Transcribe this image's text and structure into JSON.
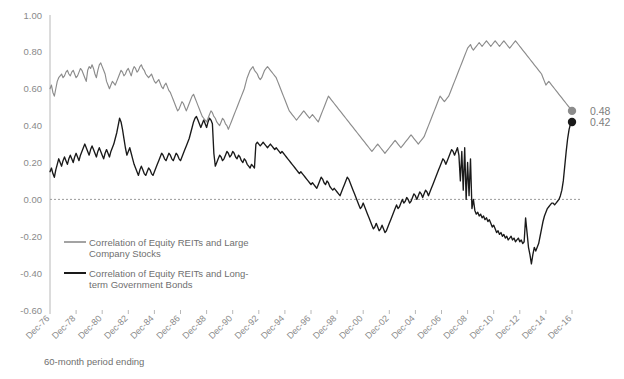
{
  "chart_data": {
    "type": "line",
    "title": "",
    "xlabel": "60-month period ending",
    "ylabel": "",
    "ylim": [
      -0.6,
      1.0
    ],
    "ytick_values": [
      1.0,
      0.8,
      0.6,
      0.4,
      0.2,
      0.0,
      -0.2,
      -0.4,
      -0.6
    ],
    "ytick_labels": [
      "1.00",
      "0.80",
      "0.60",
      "0.40",
      "0.20",
      "0.00",
      "-0.20",
      "-0.40",
      "-0.60"
    ],
    "xtick_labels": [
      "Dec-76",
      "Dec-78",
      "Dec-80",
      "Dec-82",
      "Dec-84",
      "Dec-86",
      "Dec-88",
      "Dec-90",
      "Dec-92",
      "Dec-94",
      "Dec-96",
      "Dec-98",
      "Dec-00",
      "Dec-02",
      "Dec-04",
      "Dec-06",
      "Dec-08",
      "Dec-10",
      "Dec-12",
      "Dec-14",
      "Dec-16"
    ],
    "x_start": 1976.0,
    "x_end": 2016.92,
    "grid": false,
    "zero_line": true,
    "legend_position": "lower-left-inside",
    "series": [
      {
        "name": "Correlation of Equity REITs and Large Company Stocks",
        "color": "#8c8c8c",
        "end_value": 0.48,
        "end_label": "0.48",
        "values": [
          0.6,
          0.62,
          0.58,
          0.56,
          0.6,
          0.64,
          0.66,
          0.67,
          0.68,
          0.66,
          0.67,
          0.69,
          0.7,
          0.68,
          0.67,
          0.69,
          0.7,
          0.68,
          0.66,
          0.67,
          0.69,
          0.71,
          0.7,
          0.68,
          0.66,
          0.64,
          0.7,
          0.72,
          0.71,
          0.73,
          0.71,
          0.68,
          0.66,
          0.7,
          0.73,
          0.74,
          0.72,
          0.7,
          0.68,
          0.64,
          0.62,
          0.6,
          0.62,
          0.64,
          0.63,
          0.62,
          0.64,
          0.66,
          0.68,
          0.7,
          0.69,
          0.67,
          0.68,
          0.7,
          0.71,
          0.69,
          0.67,
          0.7,
          0.72,
          0.71,
          0.69,
          0.7,
          0.72,
          0.73,
          0.71,
          0.7,
          0.68,
          0.67,
          0.66,
          0.67,
          0.68,
          0.66,
          0.64,
          0.63,
          0.64,
          0.65,
          0.63,
          0.61,
          0.6,
          0.62,
          0.63,
          0.61,
          0.59,
          0.58,
          0.56,
          0.54,
          0.52,
          0.5,
          0.48,
          0.49,
          0.51,
          0.53,
          0.52,
          0.5,
          0.48,
          0.5,
          0.52,
          0.54,
          0.56,
          0.57,
          0.55,
          0.53,
          0.51,
          0.49,
          0.47,
          0.45,
          0.44,
          0.43,
          0.42,
          0.44,
          0.46,
          0.48,
          0.47,
          0.45,
          0.44,
          0.42,
          0.41,
          0.4,
          0.42,
          0.44,
          0.43,
          0.41,
          0.4,
          0.38,
          0.4,
          0.42,
          0.44,
          0.46,
          0.48,
          0.5,
          0.52,
          0.54,
          0.56,
          0.58,
          0.6,
          0.63,
          0.66,
          0.68,
          0.7,
          0.71,
          0.72,
          0.7,
          0.69,
          0.68,
          0.66,
          0.65,
          0.66,
          0.68,
          0.7,
          0.71,
          0.72,
          0.71,
          0.7,
          0.69,
          0.68,
          0.67,
          0.66,
          0.64,
          0.62,
          0.6,
          0.58,
          0.56,
          0.54,
          0.52,
          0.5,
          0.48,
          0.47,
          0.46,
          0.45,
          0.44,
          0.43,
          0.44,
          0.45,
          0.46,
          0.47,
          0.48,
          0.47,
          0.46,
          0.45,
          0.44,
          0.45,
          0.46,
          0.45,
          0.44,
          0.43,
          0.42,
          0.44,
          0.46,
          0.48,
          0.5,
          0.52,
          0.54,
          0.56,
          0.55,
          0.54,
          0.53,
          0.52,
          0.51,
          0.5,
          0.49,
          0.48,
          0.47,
          0.46,
          0.45,
          0.44,
          0.43,
          0.42,
          0.41,
          0.4,
          0.39,
          0.38,
          0.37,
          0.36,
          0.35,
          0.34,
          0.33,
          0.32,
          0.31,
          0.3,
          0.29,
          0.28,
          0.27,
          0.26,
          0.27,
          0.28,
          0.29,
          0.3,
          0.29,
          0.28,
          0.27,
          0.26,
          0.25,
          0.26,
          0.27,
          0.28,
          0.29,
          0.3,
          0.31,
          0.32,
          0.31,
          0.3,
          0.29,
          0.28,
          0.29,
          0.3,
          0.31,
          0.32,
          0.33,
          0.34,
          0.35,
          0.34,
          0.33,
          0.32,
          0.31,
          0.3,
          0.31,
          0.32,
          0.33,
          0.34,
          0.36,
          0.38,
          0.4,
          0.42,
          0.44,
          0.46,
          0.48,
          0.5,
          0.52,
          0.54,
          0.56,
          0.55,
          0.54,
          0.53,
          0.54,
          0.55,
          0.56,
          0.58,
          0.6,
          0.62,
          0.64,
          0.66,
          0.68,
          0.7,
          0.72,
          0.74,
          0.76,
          0.78,
          0.8,
          0.82,
          0.83,
          0.84,
          0.82,
          0.81,
          0.82,
          0.83,
          0.84,
          0.85,
          0.84,
          0.83,
          0.84,
          0.85,
          0.86,
          0.85,
          0.84,
          0.83,
          0.84,
          0.85,
          0.86,
          0.85,
          0.84,
          0.83,
          0.84,
          0.85,
          0.86,
          0.85,
          0.84,
          0.83,
          0.82,
          0.83,
          0.84,
          0.85,
          0.86,
          0.85,
          0.84,
          0.83,
          0.82,
          0.81,
          0.8,
          0.79,
          0.78,
          0.77,
          0.76,
          0.75,
          0.74,
          0.73,
          0.72,
          0.71,
          0.7,
          0.69,
          0.68,
          0.66,
          0.64,
          0.62,
          0.63,
          0.64,
          0.63,
          0.62,
          0.61,
          0.6,
          0.59,
          0.58,
          0.57,
          0.56,
          0.55,
          0.54,
          0.53,
          0.52,
          0.51,
          0.5,
          0.49,
          0.48
        ]
      },
      {
        "name": "Correlation of Equity REITs and Long-term Government Bonds",
        "color": "#1a1a1a",
        "end_value": 0.42,
        "end_label": "0.42",
        "values": [
          0.15,
          0.17,
          0.14,
          0.12,
          0.16,
          0.19,
          0.22,
          0.2,
          0.18,
          0.21,
          0.23,
          0.21,
          0.19,
          0.22,
          0.24,
          0.22,
          0.2,
          0.23,
          0.25,
          0.23,
          0.21,
          0.24,
          0.26,
          0.28,
          0.3,
          0.28,
          0.26,
          0.24,
          0.27,
          0.29,
          0.27,
          0.25,
          0.23,
          0.26,
          0.28,
          0.26,
          0.24,
          0.22,
          0.25,
          0.27,
          0.25,
          0.23,
          0.26,
          0.28,
          0.3,
          0.33,
          0.36,
          0.4,
          0.44,
          0.42,
          0.38,
          0.33,
          0.28,
          0.24,
          0.26,
          0.28,
          0.25,
          0.22,
          0.19,
          0.17,
          0.15,
          0.13,
          0.16,
          0.18,
          0.16,
          0.14,
          0.13,
          0.15,
          0.17,
          0.16,
          0.14,
          0.13,
          0.15,
          0.17,
          0.19,
          0.21,
          0.23,
          0.25,
          0.24,
          0.22,
          0.21,
          0.23,
          0.25,
          0.24,
          0.22,
          0.21,
          0.23,
          0.25,
          0.24,
          0.22,
          0.21,
          0.23,
          0.25,
          0.27,
          0.29,
          0.31,
          0.33,
          0.36,
          0.39,
          0.42,
          0.44,
          0.45,
          0.43,
          0.41,
          0.39,
          0.41,
          0.43,
          0.41,
          0.39,
          0.42,
          0.44,
          0.43,
          0.41,
          0.25,
          0.18,
          0.2,
          0.22,
          0.24,
          0.23,
          0.21,
          0.22,
          0.24,
          0.26,
          0.25,
          0.23,
          0.24,
          0.26,
          0.25,
          0.23,
          0.22,
          0.24,
          0.23,
          0.21,
          0.2,
          0.22,
          0.21,
          0.19,
          0.18,
          0.17,
          0.19,
          0.18,
          0.17,
          0.3,
          0.31,
          0.3,
          0.29,
          0.3,
          0.31,
          0.3,
          0.29,
          0.28,
          0.29,
          0.3,
          0.29,
          0.28,
          0.27,
          0.28,
          0.27,
          0.26,
          0.25,
          0.26,
          0.25,
          0.24,
          0.23,
          0.22,
          0.21,
          0.2,
          0.19,
          0.18,
          0.17,
          0.16,
          0.15,
          0.14,
          0.15,
          0.14,
          0.13,
          0.12,
          0.11,
          0.1,
          0.09,
          0.08,
          0.09,
          0.08,
          0.07,
          0.06,
          0.08,
          0.1,
          0.12,
          0.11,
          0.09,
          0.08,
          0.1,
          0.09,
          0.07,
          0.06,
          0.05,
          0.06,
          0.05,
          0.04,
          0.03,
          0.02,
          0.04,
          0.06,
          0.08,
          0.1,
          0.12,
          0.11,
          0.09,
          0.07,
          0.05,
          0.03,
          0.01,
          -0.01,
          -0.03,
          -0.05,
          -0.04,
          -0.02,
          -0.04,
          -0.06,
          -0.08,
          -0.1,
          -0.12,
          -0.14,
          -0.16,
          -0.15,
          -0.13,
          -0.15,
          -0.17,
          -0.16,
          -0.14,
          -0.16,
          -0.18,
          -0.17,
          -0.15,
          -0.13,
          -0.11,
          -0.09,
          -0.07,
          -0.05,
          -0.03,
          -0.05,
          -0.04,
          -0.02,
          0.0,
          -0.02,
          -0.01,
          0.01,
          0.0,
          -0.02,
          -0.01,
          0.01,
          0.03,
          0.02,
          0.0,
          0.02,
          0.04,
          0.03,
          0.01,
          0.03,
          0.05,
          0.04,
          0.02,
          0.04,
          0.06,
          0.08,
          0.1,
          0.12,
          0.14,
          0.16,
          0.18,
          0.2,
          0.22,
          0.21,
          0.19,
          0.21,
          0.23,
          0.25,
          0.27,
          0.26,
          0.24,
          0.26,
          0.28,
          0.24,
          0.1,
          0.26,
          0.05,
          0.28,
          0.0,
          0.2,
          0.02,
          0.22,
          -0.05,
          0.0,
          -0.06,
          -0.08,
          -0.07,
          -0.09,
          -0.08,
          -0.1,
          -0.09,
          -0.11,
          -0.1,
          -0.12,
          -0.11,
          -0.13,
          -0.15,
          -0.14,
          -0.16,
          -0.18,
          -0.17,
          -0.19,
          -0.18,
          -0.2,
          -0.19,
          -0.21,
          -0.2,
          -0.22,
          -0.21,
          -0.2,
          -0.22,
          -0.21,
          -0.23,
          -0.22,
          -0.21,
          -0.23,
          -0.22,
          -0.24,
          -0.23,
          -0.1,
          -0.18,
          -0.26,
          -0.3,
          -0.35,
          -0.3,
          -0.26,
          -0.28,
          -0.26,
          -0.24,
          -0.2,
          -0.16,
          -0.12,
          -0.09,
          -0.07,
          -0.05,
          -0.04,
          -0.03,
          -0.02,
          -0.02,
          -0.03,
          -0.02,
          -0.01,
          0.0,
          0.02,
          0.05,
          0.1,
          0.18,
          0.26,
          0.33,
          0.38,
          0.41,
          0.42
        ]
      }
    ]
  },
  "legend": {
    "items": [
      {
        "label_line1": "Correlation of Equity REITs and Large",
        "label_line2": "Company Stocks",
        "color": "#8c8c8c"
      },
      {
        "label_line1": "Correlation of Equity REITs and Long-",
        "label_line2": "term Government Bonds",
        "color": "#1a1a1a"
      }
    ]
  }
}
